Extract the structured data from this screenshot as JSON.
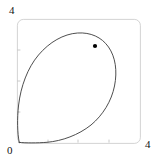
{
  "figure": {
    "name": "parametric-loop-plot",
    "background_color": "#ffffff",
    "width": 162,
    "height": 167
  },
  "labels": {
    "y_max": "4",
    "origin": "0",
    "x_max": "4"
  },
  "frame": {
    "color": "#c8c8c8",
    "stroke_width": 0.8,
    "corner_radius": 6,
    "left": 17,
    "top": 19,
    "right": 140,
    "bottom": 143
  },
  "ticks": {
    "color": "#bdbdbd",
    "x_positions": [
      1,
      2,
      3
    ],
    "y_positions": [
      1,
      2,
      3
    ]
  },
  "curve": {
    "color": "#3a3a3a",
    "stroke_width": 0.9,
    "fill": "none",
    "path": "M 19 142 C 17.5 132 17.0 118 18.5 104 C 20.5 86 27 68 38 55 C 49 42 63 34 77 33 C 90 32 101 37 108 47 C 115 57 117 71 114 86 C 111 101 103 115 91 125 C 78 135 62 141 47 142 C 37 143 26 143 19 142 Z"
  },
  "marker": {
    "name": "curve-point-marker",
    "color": "#000000",
    "x": 95,
    "y": 46,
    "radius": 2.1
  },
  "chart_data": {
    "type": "line",
    "title": "",
    "xlabel": "",
    "ylabel": "",
    "xlim": [
      0,
      4
    ],
    "ylim": [
      0,
      4
    ],
    "grid": false,
    "legend": null,
    "tick_labels": {
      "x": [
        "0",
        "4"
      ],
      "y": [
        "0",
        "4"
      ]
    },
    "series": [
      {
        "name": "parametric-loop",
        "style": "closed-loop-curve",
        "color": "#3a3a3a",
        "x": [
          0.0,
          0.05,
          0.18,
          0.4,
          0.7,
          1.05,
          1.45,
          1.9,
          2.3,
          2.65,
          2.9,
          3.1,
          3.22,
          3.25,
          3.18,
          3.02,
          2.78,
          2.45,
          2.05,
          1.6,
          1.15,
          0.75,
          0.42,
          0.18,
          0.05,
          0.0
        ],
        "y": [
          0.0,
          0.35,
          0.75,
          1.2,
          1.7,
          2.2,
          2.7,
          3.15,
          3.45,
          3.58,
          3.58,
          3.45,
          3.2,
          2.9,
          2.55,
          2.2,
          1.85,
          1.5,
          1.18,
          0.9,
          0.65,
          0.45,
          0.28,
          0.14,
          0.05,
          0.0
        ]
      }
    ],
    "annotations": [
      {
        "name": "highlighted-point",
        "type": "point-marker",
        "x": 2.55,
        "y": 3.55,
        "color": "#000000"
      }
    ]
  }
}
